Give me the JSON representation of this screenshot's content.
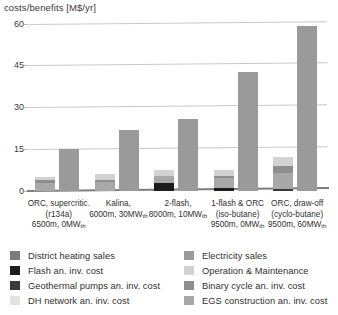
{
  "chart_data": {
    "type": "bar",
    "title": "costs/benefits [M$/yr]",
    "xlabel": "",
    "ylabel": "costs/benefits [M$/yr]",
    "ylim": [
      0,
      62
    ],
    "yticks": [
      0,
      15,
      30,
      45,
      60
    ],
    "grid": true,
    "legend_position": "bottom",
    "bar_mode": "stacked-grouped",
    "categories": [
      "ORC, supercritic. (r134a) 6500m, 0MWth",
      "Kalina, 6000m, 30MWth",
      "2-flash, 8000m, 10MWth",
      "1-flash & ORC (iso-butane) 9500m, 0MWth",
      "ORC, draw-off (cyclo-butane) 9500m, 60MWth"
    ],
    "category_lines": [
      [
        "ORC, supercritic.",
        "(r134a)",
        "6500m, 0MW",
        "th"
      ],
      [
        "Kalina,",
        "6000m, 30MW",
        "th"
      ],
      [
        "2-flash,",
        "8000m, 10MW",
        "th"
      ],
      [
        "1-flash & ORC",
        "(iso-butane)",
        "9500m, 0MW",
        "th"
      ],
      [
        "ORC, draw-off",
        "(cyclo-butane)",
        "9500m, 60MW",
        "th"
      ]
    ],
    "series": [
      {
        "name": "District heating sales",
        "color": "#7b7b7b",
        "stack": "benefit",
        "values": [
          0,
          0,
          0,
          0,
          0
        ]
      },
      {
        "name": "Electricity sales",
        "color": "#9a9a9a",
        "stack": "benefit",
        "values": [
          15.0,
          21.8,
          25.8,
          42.8,
          59.3
        ]
      },
      {
        "name": "Flash an. inv. cost",
        "color": "#1c1c1c",
        "stack": "cost",
        "values": [
          0,
          0,
          3.0,
          1.2,
          0
        ]
      },
      {
        "name": "Operation & Maintenance",
        "color": "#d2d2d2",
        "stack": "cost",
        "values": [
          1.1,
          2.2,
          2.0,
          2.2,
          3.4
        ]
      },
      {
        "name": "Geothermal pumps an. inv. cost",
        "color": "#3a3a3a",
        "stack": "cost",
        "values": [
          0,
          0,
          0,
          0,
          0.9
        ]
      },
      {
        "name": "Binary cycle an. inv. cost",
        "color": "#8e8e8e",
        "stack": "cost",
        "values": [
          0.9,
          0.7,
          0,
          0.5,
          2.2
        ]
      },
      {
        "name": "DH network an. inv. cost",
        "color": "#e2e2e2",
        "stack": "cost",
        "values": [
          0,
          0,
          0,
          0,
          0
        ]
      },
      {
        "name": "EGS construction an. inv. cost",
        "color": "#a8a8a8",
        "stack": "cost",
        "values": [
          3.0,
          3.3,
          2.4,
          3.6,
          5.7
        ]
      }
    ],
    "cost_totals": [
      5.0,
      6.2,
      7.4,
      7.5,
      12.2
    ],
    "benefit_totals": [
      15.0,
      21.8,
      25.8,
      42.8,
      59.3
    ]
  },
  "legend": {
    "left": [
      {
        "label": "District heating sales",
        "color": "#7b7b7b",
        "icon": "legend-swatch-district-heating-sales"
      },
      {
        "label": "Flash an. inv. cost",
        "color": "#1c1c1c",
        "icon": "legend-swatch-flash-inv-cost"
      },
      {
        "label": "Geothermal pumps an. inv. cost",
        "color": "#3a3a3a",
        "icon": "legend-swatch-geothermal-pumps-inv-cost"
      },
      {
        "label": "DH network an. inv. cost",
        "color": "#e2e2e2",
        "icon": "legend-swatch-dh-network-inv-cost"
      }
    ],
    "right": [
      {
        "label": "Electricity sales",
        "color": "#9a9a9a",
        "icon": "legend-swatch-electricity-sales"
      },
      {
        "label": "Operation & Maintenance",
        "color": "#d2d2d2",
        "icon": "legend-swatch-operation-maintenance"
      },
      {
        "label": "Binary cycle an. inv. cost",
        "color": "#8e8e8e",
        "icon": "legend-swatch-binary-cycle-inv-cost"
      },
      {
        "label": "EGS construction an. inv. cost",
        "color": "#a8a8a8",
        "icon": "legend-swatch-egs-construction-inv-cost"
      }
    ]
  },
  "colors": {
    "grid": "#c9c9c9",
    "baseline": "#7d7d7d",
    "text": "#2f2f2f",
    "background": "#ffffff"
  }
}
